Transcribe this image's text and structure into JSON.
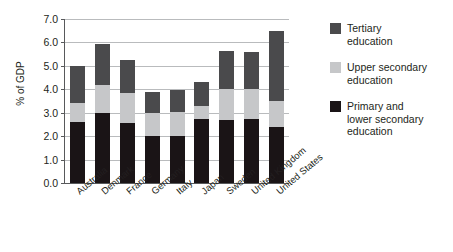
{
  "chart_data": {
    "type": "bar",
    "title": "",
    "subtitle": "",
    "xlabel": "",
    "ylabel": "% of GDP",
    "ylim": [
      0.0,
      7.0
    ],
    "ytick_step": 1.0,
    "ytick_labels": [
      "7.0",
      "6.0",
      "5.0",
      "4.0",
      "3.0",
      "2.0",
      "1.0",
      "0.0"
    ],
    "ytick_values": [
      7.0,
      6.0,
      5.0,
      4.0,
      3.0,
      2.0,
      1.0,
      0.0
    ],
    "grid": true,
    "stacked": true,
    "legend_position": "right",
    "categories": [
      "Australia",
      "Denmark",
      "France",
      "Germany",
      "Italy",
      "Japan",
      "Sweden",
      "United Kingdom",
      "United States"
    ],
    "series": [
      {
        "name": "Primary and lower secondary education",
        "color": "#1a1416",
        "values": [
          2.6,
          3.0,
          2.55,
          2.0,
          2.0,
          2.75,
          2.7,
          2.75,
          2.4
        ]
      },
      {
        "name": "Upper secondary education",
        "color": "#c6c7c9",
        "values": [
          0.8,
          1.2,
          1.3,
          1.0,
          1.05,
          0.55,
          1.3,
          1.25,
          1.1
        ]
      },
      {
        "name": "Tertiary education",
        "color": "#4a4a4c",
        "values": [
          1.6,
          1.75,
          1.4,
          0.9,
          0.9,
          1.0,
          1.65,
          1.6,
          3.0
        ]
      }
    ],
    "totals": [
      5.0,
      5.95,
      5.25,
      3.9,
      3.95,
      4.3,
      5.65,
      5.6,
      6.5
    ]
  },
  "legend": {
    "entries": [
      {
        "label": "Tertiary\neducation",
        "line1": "Tertiary",
        "line2": "education",
        "line3": "",
        "color": "#4a4a4c"
      },
      {
        "label": "Upper secondary\neducation",
        "line1": "Upper secondary",
        "line2": "education",
        "line3": "",
        "color": "#c6c7c9"
      },
      {
        "label": "Primary and\nlower secondary\neducation",
        "line1": "Primary and",
        "line2": "lower secondary",
        "line3": "education",
        "color": "#1a1416"
      }
    ]
  }
}
